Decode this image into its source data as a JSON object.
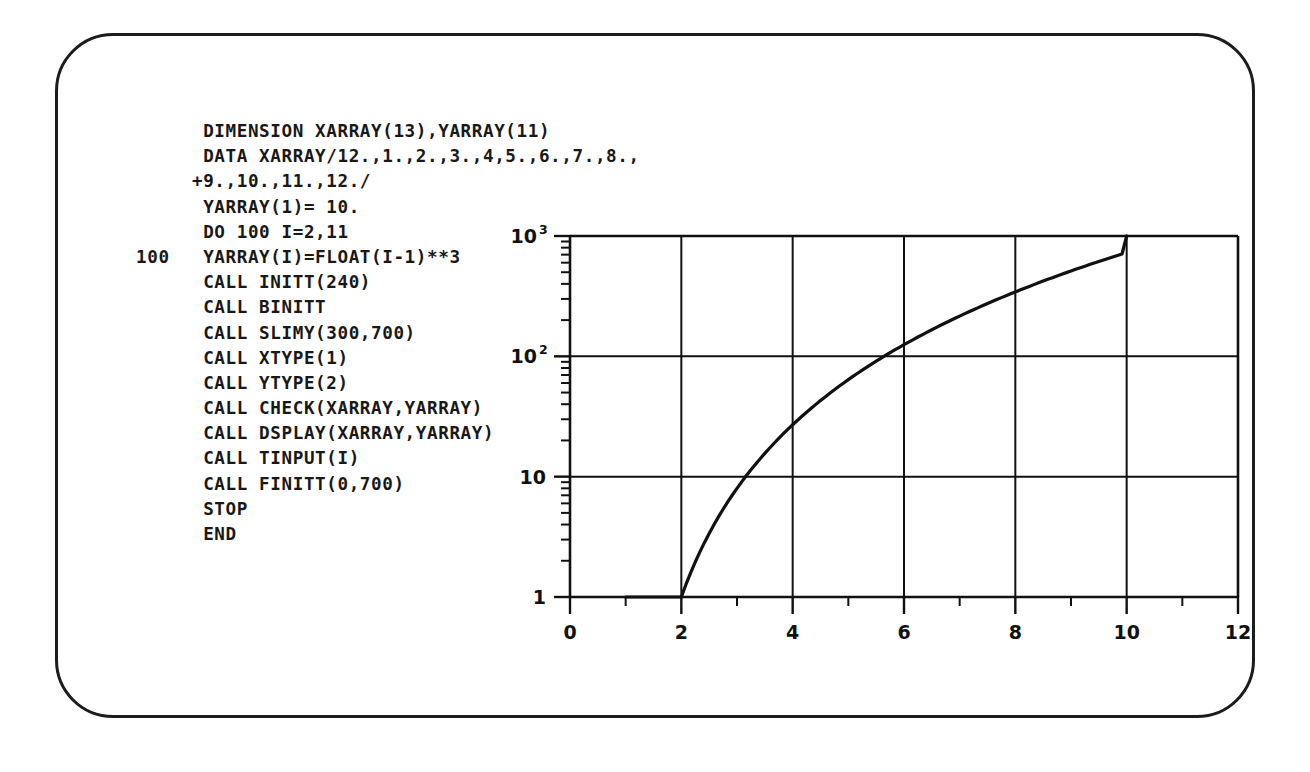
{
  "terminal": {
    "device_name": "crt-terminal-screen",
    "bezel_color": "#1c1c1c",
    "screen_color": "#ffffff",
    "ink_color": "#111111"
  },
  "code": {
    "language": "FORTRAN",
    "lines": [
      "      DIMENSION XARRAY(13),YARRAY(11)",
      "      DATA XARRAY/12.,1.,2.,3.,4,5.,6.,7.,8.,",
      "     +9.,10.,11.,12./",
      "      YARRAY(1)= 10.",
      "      DO 100 I=2,11",
      "100   YARRAY(I)=FLOAT(I-1)**3",
      "      CALL INITT(240)",
      "      CALL BINITT",
      "      CALL SLIMY(300,700)",
      "      CALL XTYPE(1)",
      "      CALL YTYPE(2)",
      "      CALL CHECK(XARRAY,YARRAY)",
      "      CALL DSPLAY(XARRAY,YARRAY)",
      "      CALL TINPUT(I)",
      "      CALL FINITT(0,700)",
      "      STOP",
      "      END"
    ]
  },
  "chart_data": {
    "type": "line",
    "title": "",
    "xlabel": "",
    "ylabel": "",
    "xscale": "linear",
    "yscale": "log",
    "xlim": [
      0,
      12
    ],
    "ylim": [
      1,
      1000
    ],
    "grid": true,
    "legend": null,
    "x_ticks": [
      0,
      2,
      4,
      6,
      8,
      10,
      12
    ],
    "x_tick_labels": [
      "0",
      "2",
      "4",
      "6",
      "8",
      "10",
      "12"
    ],
    "x_minor_ticks": [
      1,
      3,
      5,
      7,
      9,
      11
    ],
    "y_ticks": [
      1,
      10,
      100,
      1000
    ],
    "y_tick_labels": [
      "1",
      "10",
      "10²",
      "10³"
    ],
    "y_tick_label_parts": [
      {
        "base": "1",
        "exp": ""
      },
      {
        "base": "10",
        "exp": ""
      },
      {
        "base": "10",
        "exp": "2"
      },
      {
        "base": "10",
        "exp": "3"
      }
    ],
    "y_minor_ticks": [
      2,
      3,
      4,
      5,
      6,
      7,
      8,
      9,
      20,
      30,
      40,
      50,
      60,
      70,
      80,
      90,
      200,
      300,
      400,
      500,
      600,
      700,
      800,
      900
    ],
    "series": [
      {
        "name": "YARRAY = (I-1)**3",
        "x": [
          1,
          2,
          3,
          4,
          5,
          6,
          7,
          8,
          9,
          10
        ],
        "y": [
          1,
          8,
          27,
          64,
          125,
          216,
          343,
          512,
          729,
          1000
        ]
      }
    ]
  }
}
